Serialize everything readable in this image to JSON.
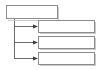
{
  "diagram": {
    "type": "tree",
    "title": "",
    "canvas": {
      "width": 101,
      "height": 70,
      "background": "#ffffff"
    },
    "style": {
      "box_fill": "#ffffff",
      "box_border": "#8c8c8c",
      "shadow_color": "#c9c9c9",
      "connector_color": "#6b6b6b",
      "arrow_color": "#3a3a3a"
    },
    "root": {
      "label": "",
      "x": 6,
      "y": 5,
      "width": 52,
      "height": 14
    },
    "children": [
      {
        "label": "",
        "x": 38,
        "y": 20,
        "width": 57,
        "height": 13
      },
      {
        "label": "",
        "x": 38,
        "y": 36,
        "width": 57,
        "height": 13
      },
      {
        "label": "",
        "x": 38,
        "y": 52,
        "width": 57,
        "height": 13
      }
    ],
    "connectors": {
      "stem_x": 14,
      "stem_top": 19,
      "stem_bottom": 58,
      "branch_y": [
        26,
        42,
        58
      ],
      "branch_end_x": 38,
      "arrow_size": 4
    }
  }
}
